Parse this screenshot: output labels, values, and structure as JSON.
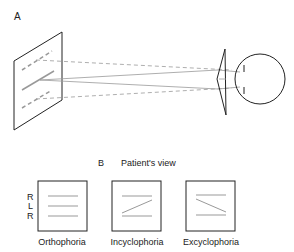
{
  "panel_a": {
    "label": "A"
  },
  "panel_b": {
    "label": "B",
    "title": "Patient's view",
    "row_labels": [
      "R",
      "L",
      "R"
    ],
    "views": [
      {
        "name": "Orthophoria",
        "middle_line": "horizontal"
      },
      {
        "name": "Incyclophoria",
        "middle_line": "rising-to-right"
      },
      {
        "name": "Excyclophoria",
        "middle_line": "falling-to-right"
      }
    ]
  },
  "colors": {
    "outline": "#222222",
    "line": "#9a9a9a"
  }
}
